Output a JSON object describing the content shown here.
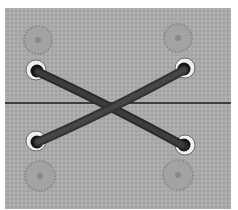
{
  "image": {
    "description": "Photograph of gray fabric with four metal grommets laced with a dark cord in an X pattern; stitched circular marks above and below the grommets; horizontal seam line across the middle",
    "colors": {
      "fabric": "#a9a9a7",
      "lace": "#2e2e2e",
      "grommet_ring": "#e8e8e6",
      "seam": "#1a1a1a",
      "stitch_circle": "#8a8a88"
    }
  }
}
